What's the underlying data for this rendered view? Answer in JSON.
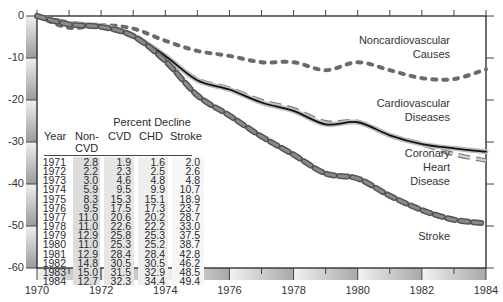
{
  "chart_data": {
    "type": "line",
    "title": "",
    "xlabel": "",
    "ylabel": "",
    "xlim": [
      1970,
      1984
    ],
    "ylim": [
      -60,
      0
    ],
    "x_ticks": [
      "1970",
      "1972",
      "1974",
      "1976",
      "1978",
      "1980",
      "1982",
      "1984"
    ],
    "y_ticks": [
      "0",
      "-10",
      "-20",
      "-30",
      "-40",
      "-50",
      "-60"
    ],
    "grid": false,
    "x": [
      1970,
      1971,
      1972,
      1973,
      1974,
      1975,
      1976,
      1977,
      1978,
      1979,
      1980,
      1981,
      1982,
      1983,
      1984
    ],
    "series": [
      {
        "name": "Noncardiovascular Causes",
        "style": "dotted",
        "values": [
          0,
          -2.8,
          -2.2,
          -3.0,
          -5.9,
          -8.3,
          -9.5,
          -11.0,
          -11.0,
          -12.9,
          -11.0,
          -12.9,
          -14.8,
          -15.0,
          -12.7
        ]
      },
      {
        "name": "Cardiovascular Diseases",
        "style": "solid",
        "values": [
          0,
          -1.9,
          -2.3,
          -4.6,
          -9.5,
          -15.3,
          -17.5,
          -20.6,
          -22.6,
          -25.8,
          -25.3,
          -28.4,
          -30.5,
          -31.5,
          -32.3
        ]
      },
      {
        "name": "Coronary Heart Disease",
        "style": "dashed",
        "values": [
          0,
          -1.6,
          -2.5,
          -4.8,
          -9.9,
          -15.1,
          -17.3,
          -20.2,
          -22.2,
          -25.3,
          -25.2,
          -28.4,
          -30.5,
          -32.9,
          -34.4
        ]
      },
      {
        "name": "Stroke",
        "style": "heavy-dashed",
        "values": [
          0,
          -2.0,
          -2.6,
          -4.8,
          -10.7,
          -18.9,
          -23.7,
          -28.7,
          -33.0,
          -37.5,
          -38.7,
          -42.8,
          -46.2,
          -48.5,
          -49.4
        ]
      }
    ],
    "annotations": [
      {
        "text": "Noncardiovascular Causes",
        "lines": [
          "Noncardiovascular",
          "Causes"
        ]
      },
      {
        "text": "Cardiovascular Diseases",
        "lines": [
          "Cardiovascular",
          "Diseases"
        ]
      },
      {
        "text": "Coronary Heart Disease",
        "lines": [
          "Coronary",
          "Heart",
          "Disease"
        ]
      },
      {
        "text": "Stroke",
        "lines": [
          "Stroke"
        ]
      }
    ],
    "inset_table": {
      "title": "Percent Decline",
      "columns": [
        "Year",
        "Non-CVD",
        "CVD",
        "CHD",
        "Stroke"
      ],
      "rows": [
        [
          "1971",
          "2.8",
          "1.9",
          "1.6",
          "2.0"
        ],
        [
          "1972",
          "2.2",
          "2.3",
          "2.5",
          "2.6"
        ],
        [
          "1973",
          "3.0",
          "4.6",
          "4.8",
          "4.8"
        ],
        [
          "1974",
          "5.9",
          "9.5",
          "9.9",
          "10.7"
        ],
        [
          "1975",
          "8.3",
          "15.3",
          "15.1",
          "18.9"
        ],
        [
          "1976",
          "9.5",
          "17.5",
          "17.3",
          "23.7"
        ],
        [
          "1977",
          "11.0",
          "20.6",
          "20.2",
          "28.7"
        ],
        [
          "1978",
          "11.0",
          "22.6",
          "22.2",
          "33.0"
        ],
        [
          "1979",
          "12.9",
          "25.8",
          "25.3",
          "37.5"
        ],
        [
          "1980",
          "11.0",
          "25.3",
          "25.2",
          "38.7"
        ],
        [
          "1981",
          "12.9",
          "28.4",
          "28.4",
          "42.8"
        ],
        [
          "1982",
          "14.8",
          "30.5",
          "30.5",
          "46.2"
        ],
        [
          "1983",
          "15.0",
          "31.5",
          "32.9",
          "48.5"
        ],
        [
          "1984",
          "12.7",
          "32.3",
          "34.4",
          "49.4"
        ]
      ]
    }
  },
  "labels": {
    "noncvd": [
      "Noncardiovascular",
      "Causes"
    ],
    "cvd": [
      "Cardiovascular",
      "Diseases"
    ],
    "chd": [
      "Coronary",
      "Heart",
      "Disease"
    ],
    "stroke": [
      "Stroke"
    ]
  },
  "table": {
    "title": "Percent Decline",
    "h_year": "Year",
    "h_noncvd_1": "Non-",
    "h_noncvd_2": "CVD",
    "h_cvd": "CVD",
    "h_chd": "CHD",
    "h_stroke": "Stroke"
  }
}
